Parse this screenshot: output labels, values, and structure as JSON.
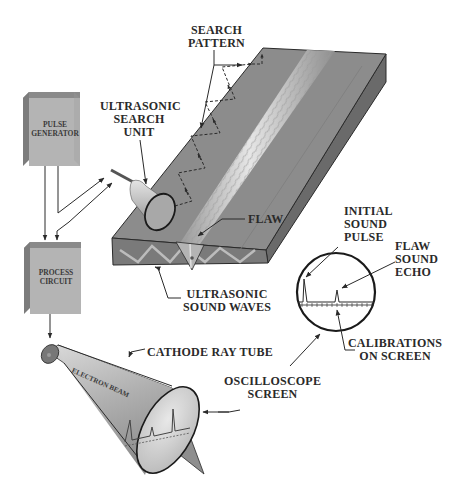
{
  "diagram": {
    "components": {
      "pulse_generator": {
        "lines": [
          "PULSE",
          "GENERATOR"
        ]
      },
      "process_circuit": {
        "lines": [
          "PROCESS",
          "CIRCUIT"
        ]
      },
      "electron_beam": "ELECTRON BEAM"
    },
    "labels": {
      "search_pattern": [
        "SEARCH",
        "PATTERN"
      ],
      "ultrasonic_search_unit": [
        "ULTRASONIC",
        "SEARCH",
        "UNIT"
      ],
      "flaw": [
        "FLAW"
      ],
      "initial_sound_pulse": [
        "INITIAL",
        "SOUND",
        "PULSE"
      ],
      "flaw_sound_echo": [
        "FLAW",
        "SOUND",
        "ECHO"
      ],
      "ultrasonic_sound_waves": [
        "ULTRASONIC",
        "SOUND WAVES"
      ],
      "calibrations_on_screen": [
        "CALIBRATIONS",
        "ON SCREEN"
      ],
      "cathode_ray_tube": [
        "CATHODE RAY TUBE"
      ],
      "oscilloscope_screen": [
        "OSCILLOSCOPE",
        "SCREEN"
      ]
    },
    "colors": {
      "plate_top": "#8c8c8c",
      "plate_front": "#7a7a7a",
      "plate_side": "#6a6a6a",
      "weld_bead": "#c8c8c8",
      "box_face": "#b4b4b4",
      "box_side": "#7c7c7c",
      "line": "#2a2a2a"
    }
  }
}
